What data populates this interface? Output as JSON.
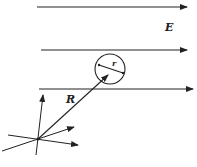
{
  "diagram": {
    "labels": {
      "field": "E",
      "position": "R",
      "radius": "r"
    },
    "field_lines_count": 3,
    "colors": {
      "ink": "#222222",
      "background": "#ffffff"
    }
  }
}
